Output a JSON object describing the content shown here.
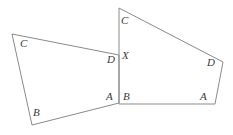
{
  "figure": {
    "name": "two-quadrilaterals-sharing-vertex-x",
    "width": 233,
    "height": 135,
    "background_color": "#ffffff",
    "stroke_color": "#8a8a8a",
    "label_color": "#3a3a3a",
    "stroke_width": 1,
    "shapes": [
      {
        "id": "left-quadrilateral",
        "points": "12,34 119,55 119,103 32,125",
        "vertex_order": [
          "top-left",
          "D",
          "A",
          "B"
        ]
      },
      {
        "id": "right-quadrilateral",
        "points": "119,8 223,62 215,104 119,104",
        "vertex_order": [
          "top",
          "D",
          "A",
          "B"
        ]
      }
    ],
    "labels": [
      {
        "id": "left-c",
        "text": "C",
        "x": 20,
        "y": 38
      },
      {
        "id": "left-d",
        "text": "D",
        "x": 107,
        "y": 54
      },
      {
        "id": "shared-x",
        "text": "X",
        "x": 122,
        "y": 50
      },
      {
        "id": "left-b",
        "text": "B",
        "x": 33,
        "y": 107
      },
      {
        "id": "left-a",
        "text": "A",
        "x": 106,
        "y": 91
      },
      {
        "id": "right-c",
        "text": "C",
        "x": 121,
        "y": 15
      },
      {
        "id": "right-d",
        "text": "D",
        "x": 207,
        "y": 57
      },
      {
        "id": "right-b",
        "text": "B",
        "x": 123,
        "y": 91
      },
      {
        "id": "right-a",
        "text": "A",
        "x": 200,
        "y": 91
      }
    ]
  }
}
